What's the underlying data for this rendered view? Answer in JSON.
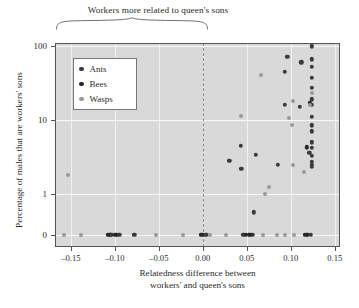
{
  "chart_data": {
    "type": "scatter",
    "title": "Workers more related to queen's sons",
    "xlabel_line1": "Relatedness difference between",
    "xlabel_line2": "workers' and queen's sons",
    "ylabel": "Percentage of males that are workers' sons",
    "xlim": [
      -0.168,
      0.156
    ],
    "ylim_labels": [
      "0",
      "1",
      "10",
      "100"
    ],
    "xticks": [
      -0.15,
      -0.1,
      -0.05,
      0.0,
      0.05,
      0.1,
      0.15
    ],
    "xticklabels": [
      "–0.15",
      "–0.10",
      "–0.05",
      "0.00",
      "0.05",
      "0.10",
      "0.15"
    ],
    "yticks": [
      0,
      1,
      10,
      100
    ],
    "yticklabels": [
      "0",
      "1",
      "10",
      "100"
    ],
    "grid": true,
    "legend_position": "upper-left",
    "annotation_line_x": 0.0,
    "annotation_brace": "spans from left axis to x = 0.00",
    "colors": {
      "ants": "#3a3a3a",
      "bees": "#262626",
      "wasps": "#9a9a9a",
      "background": "#d9d9d9",
      "gridline": "#f4f4f4",
      "axis": "#555555",
      "dashed_line": "#8a8a8a"
    },
    "series": [
      {
        "name": "Ants",
        "color": "#3a3a3a",
        "points": [
          [
            -0.107,
            0
          ],
          [
            -0.106,
            0
          ],
          [
            -0.105,
            0
          ],
          [
            -0.104,
            0
          ],
          [
            -0.098,
            0
          ],
          [
            -0.095,
            0
          ],
          [
            -0.078,
            0
          ],
          [
            0.0005,
            0
          ],
          [
            0.004,
            0
          ],
          [
            0.046,
            0
          ],
          [
            0.052,
            0
          ],
          [
            0.057,
            0
          ],
          [
            0.119,
            0
          ],
          [
            0.123,
            0
          ],
          [
            0.03,
            2.8
          ],
          [
            0.044,
            2.2
          ],
          [
            0.043,
            4.5
          ],
          [
            0.06,
            3.4
          ],
          [
            0.058,
            0.55
          ],
          [
            0.085,
            2.5
          ],
          [
            0.093,
            16
          ],
          [
            0.093,
            45
          ],
          [
            0.096,
            72
          ],
          [
            0.11,
            15
          ],
          [
            0.112,
            60
          ],
          [
            0.124,
            99
          ],
          [
            0.124,
            66
          ],
          [
            0.124,
            52
          ],
          [
            0.124,
            37
          ],
          [
            0.124,
            27
          ],
          [
            0.124,
            19
          ],
          [
            0.124,
            16
          ],
          [
            0.124,
            11
          ],
          [
            0.124,
            8.5
          ],
          [
            0.124,
            7.0
          ],
          [
            0.124,
            5.0
          ],
          [
            0.124,
            4.2
          ],
          [
            0.124,
            3.3
          ],
          [
            0.121,
            3.6
          ],
          [
            0.124,
            2.7
          ],
          [
            0.124,
            2.5
          ],
          [
            0.124,
            2.35
          ]
        ]
      },
      {
        "name": "Bees",
        "color": "#262626",
        "points": [
          [
            -0.108,
            0
          ],
          [
            -0.0995,
            0
          ],
          [
            -0.0015,
            0
          ],
          [
            0.049,
            0
          ],
          [
            0.054,
            0
          ],
          [
            0.116,
            0
          ],
          [
            0.1185,
            0
          ],
          [
            0.122,
            17
          ],
          [
            0.118,
            4.3
          ]
        ]
      },
      {
        "name": "Wasps",
        "color": "#9a9a9a",
        "points": [
          [
            -0.153,
            1.8
          ],
          [
            -0.158,
            0
          ],
          [
            -0.139,
            0
          ],
          [
            -0.0535,
            0
          ],
          [
            -0.023,
            0
          ],
          [
            0.008,
            0
          ],
          [
            0.026,
            0
          ],
          [
            0.069,
            0
          ],
          [
            0.084,
            0
          ],
          [
            0.093,
            0
          ],
          [
            0.104,
            0
          ],
          [
            0.044,
            11.5
          ],
          [
            0.066,
            40
          ],
          [
            0.075,
            1.25
          ],
          [
            0.071,
            1.0
          ],
          [
            0.098,
            10.5
          ],
          [
            0.102,
            18
          ],
          [
            0.101,
            8.5
          ],
          [
            0.103,
            2.5
          ],
          [
            0.115,
            2.0
          ],
          [
            0.124,
            23
          ],
          [
            0.1215,
            16
          ]
        ]
      }
    ]
  },
  "legend": {
    "items": [
      {
        "label": "Ants",
        "color": "#3a3a3a"
      },
      {
        "label": "Bees",
        "color": "#262626"
      },
      {
        "label": "Wasps",
        "color": "#9a9a9a"
      }
    ]
  }
}
